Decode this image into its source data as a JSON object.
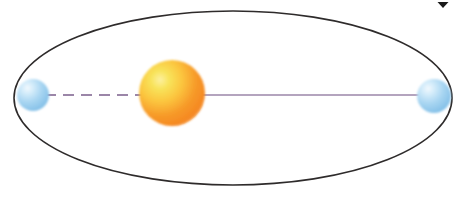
{
  "figure": {
    "type": "astronomy-orbit-diagram",
    "canvas": {
      "width": 462,
      "height": 212,
      "background": "#ffffff"
    }
  },
  "chart_data": {
    "type": "scatter",
    "xlabel": "",
    "ylabel": "",
    "grid": false,
    "legend": null,
    "xlim": [
      0,
      462
    ],
    "ylim": [
      0,
      212
    ],
    "annotations": [
      "Ellipse represents the orbital path",
      "Sun sits at one focus of the ellipse, offset from center",
      "Planet shown at both aphelion (left) and perihelion (right) vertices",
      "Major axis drawn through the Sun connecting both vertices"
    ],
    "series": [
      {
        "name": "orbit-ellipse",
        "shape": "ellipse",
        "center_x": 233,
        "center_y": 98,
        "semi_major_axis": 219,
        "semi_minor_axis": 87,
        "stroke": "#2e2b2b",
        "stroke_width": 1.6,
        "fill": "none"
      },
      {
        "name": "sun",
        "shape": "circle",
        "x": 172,
        "y": 93,
        "radius": 33,
        "fill_inner": "#f7e14a",
        "fill_mid": "#f9b739",
        "fill_outer": "#f4821f"
      },
      {
        "name": "planet-aphelion",
        "shape": "circle",
        "x": 33,
        "y": 95,
        "radius": 16,
        "fill_inner": "#e4f2fc",
        "fill_outer": "#8ec4ea"
      },
      {
        "name": "planet-perihelion",
        "shape": "circle",
        "x": 434,
        "y": 96,
        "radius": 17,
        "fill_inner": "#e4f2fc",
        "fill_outer": "#8ec4ea"
      },
      {
        "name": "major-axis-dashed-segment",
        "shape": "line",
        "x1": 45,
        "y1": 95,
        "x2": 150,
        "y2": 95,
        "stroke": "#9b86a8",
        "stroke_width": 2.2,
        "dash": "11 7"
      },
      {
        "name": "major-axis-solid-segment",
        "shape": "line",
        "x1": 196,
        "y1": 95,
        "x2": 424,
        "y2": 95,
        "stroke": "#9b86a8",
        "stroke_width": 1.3,
        "dash": "none"
      },
      {
        "name": "scan-artifact-mark",
        "shape": "triangle",
        "x": 443,
        "y": 2,
        "width": 11,
        "height": 6,
        "fill": "#1a1a1a"
      }
    ]
  },
  "colors": {
    "background": "#ffffff",
    "orbit_stroke": "#2e2b2b",
    "axis_line": "#9b86a8",
    "sun_core": "#f7e14a",
    "sun_edge": "#f4821f",
    "planet_core": "#e4f2fc",
    "planet_edge": "#8ec4ea",
    "artifact": "#1a1a1a"
  }
}
